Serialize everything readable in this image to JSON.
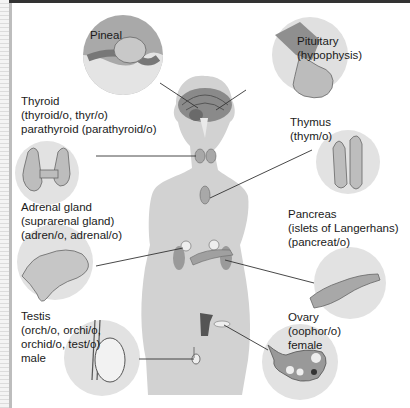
{
  "diagram": {
    "labels": {
      "pineal": {
        "lines": [
          "Pineal"
        ]
      },
      "pituitary": {
        "lines": [
          "Pituitary",
          "(hypophysis)"
        ]
      },
      "thyroid": {
        "lines": [
          "Thyroid",
          "(thyroid/o, thyr/o)",
          "parathyroid (parathyroid/o)"
        ]
      },
      "thymus": {
        "lines": [
          "Thymus",
          "(thym/o)"
        ]
      },
      "adrenal": {
        "lines": [
          "Adrenal gland",
          "(suprarenal gland)",
          "(adren/o, adrenal/o)"
        ]
      },
      "pancreas": {
        "lines": [
          "Pancreas",
          "(islets of Langerhans)",
          "(pancreat/o)"
        ]
      },
      "testis": {
        "lines": [
          "Testis",
          "(orch/o, orchi/o,",
          "orchid/o, test/o)",
          "male"
        ]
      },
      "ovary": {
        "lines": [
          "Ovary",
          "(oophor/o)",
          "female"
        ]
      }
    },
    "colors": {
      "silhouette": "#cfcfcf",
      "circle": "#e0e0e0",
      "organ": "#b5b5b5",
      "dark_organ": "#6e6e6e",
      "leader_line": "#333333"
    }
  }
}
